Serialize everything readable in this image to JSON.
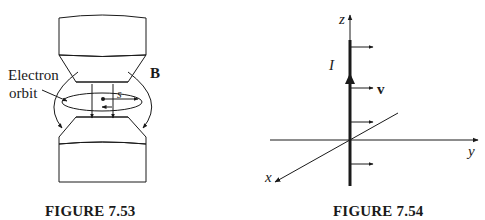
{
  "figures": [
    {
      "caption": "FIGURE 7.53",
      "labels": {
        "electron_line1": "Electron",
        "electron_line2": "orbit",
        "field": "B",
        "path": "s"
      }
    },
    {
      "caption": "FIGURE 7.54",
      "labels": {
        "z_axis": "z",
        "y_axis": "y",
        "x_axis": "x",
        "current": "I",
        "velocity": "v"
      }
    }
  ],
  "colors": {
    "ink": "#1a1a1a",
    "background": "#ffffff"
  }
}
